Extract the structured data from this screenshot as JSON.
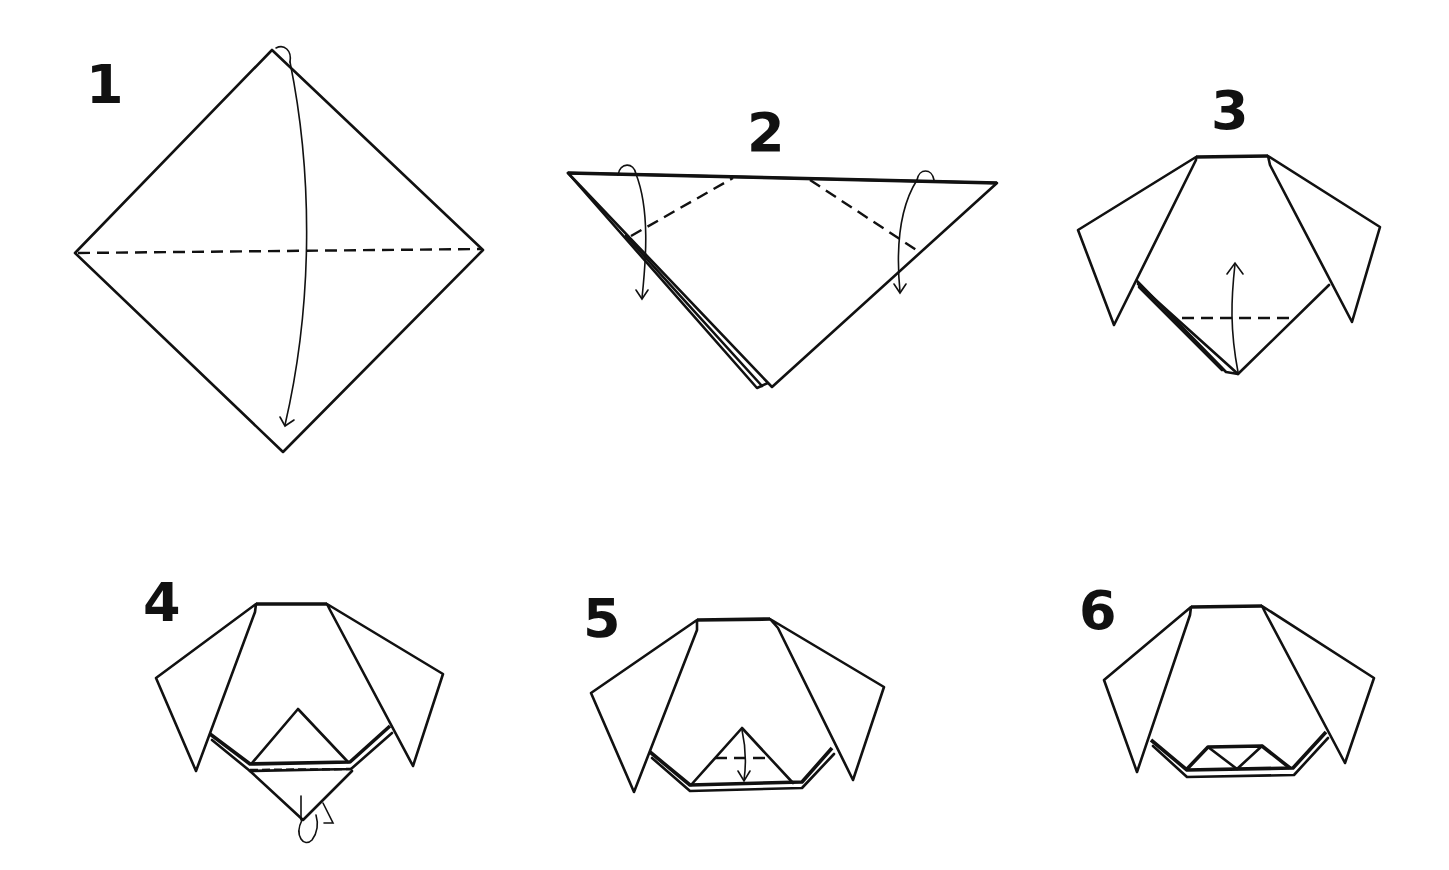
{
  "diagram": {
    "colors": {
      "ink": "#111111",
      "paper": "#ffffff"
    },
    "steps": [
      {
        "number": "1",
        "description": "Square paper as diamond; valley-fold top corner down to bottom corner along horizontal diagonal",
        "fold_type": "valley-fold",
        "arrow": "top-to-bottom"
      },
      {
        "number": "2",
        "description": "Triangle; fold both top corners down along dashed lines to form ears",
        "fold_type": "valley-fold",
        "arrow": "corners-down"
      },
      {
        "number": "3",
        "description": "Ears folded down; fold top layer of bottom point up along dashed line",
        "fold_type": "valley-fold",
        "arrow": "bottom-up"
      },
      {
        "number": "4",
        "description": "Fold the back layer's bottom point behind along dashed line",
        "fold_type": "mountain-fold",
        "arrow": "fold-behind"
      },
      {
        "number": "5",
        "description": "Fold tip of the small triangle down to form the nose",
        "fold_type": "valley-fold",
        "arrow": "tip-down"
      },
      {
        "number": "6",
        "description": "Completed dog face",
        "fold_type": "finished",
        "arrow": "none"
      }
    ]
  }
}
